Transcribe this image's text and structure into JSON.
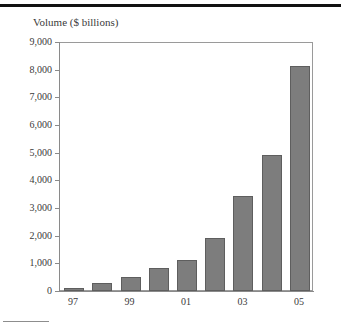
{
  "page": {
    "top_rule_name": "top-divider-rule",
    "footnote_rule_name": "footnote-divider-rule"
  },
  "chart_data": {
    "type": "bar",
    "title": "Volume ($ billions)",
    "xlabel": "",
    "ylabel": "",
    "categories": [
      "97",
      "98",
      "99",
      "00",
      "01",
      "02",
      "03",
      "04",
      "05"
    ],
    "tick_labels_shown": [
      "97",
      "99",
      "01",
      "03",
      "05"
    ],
    "values": [
      120,
      300,
      520,
      830,
      1120,
      1910,
      3450,
      4930,
      8150
    ],
    "ylim": [
      0,
      9000
    ],
    "ytick_values": [
      0,
      1000,
      2000,
      3000,
      4000,
      5000,
      6000,
      7000,
      8000,
      9000
    ],
    "ytick_labels": [
      "0",
      "1,000",
      "2,000",
      "3,000",
      "4,000",
      "5,000",
      "6,000",
      "7,000",
      "8,000",
      "9,000"
    ],
    "grid": false,
    "legend": null,
    "bar_color": "#7d7d7d",
    "bar_border_color": "#5e5e5e",
    "frame_color": "#9a9a9a"
  }
}
